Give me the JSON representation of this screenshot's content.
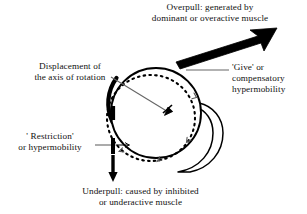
{
  "figure": {
    "background_color": "#ffffff",
    "stroke_color": "#000000",
    "leader_line_color": "#555555"
  },
  "labels": {
    "overpull": "Overpull: generated by\ndominant or overactive muscle",
    "underpull": "Underpull: caused by inhibited\nor underactive muscle",
    "displacement": "Displacement of\nthe axis of rotation",
    "restriction": "' Restriction'\nor hypermobility",
    "give": "'Give'  or\ncompensatory\nhypermobility"
  },
  "elements": {
    "joint_circle": "solid-circle",
    "displaced_axis_path": "dashed-ellipse",
    "overpull_arrow": "thick-arrow-up-right",
    "underpull_arrow": "thick-arrow-down",
    "restriction_bar": "vertical-bar-marker",
    "give_crescent": "crescent-hook-shape",
    "axis_pointer": "thin-arrow-pointer"
  }
}
